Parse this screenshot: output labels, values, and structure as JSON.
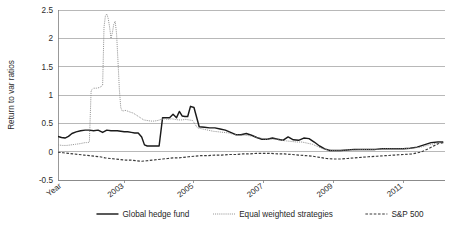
{
  "chart_data": {
    "type": "line",
    "title": "",
    "xlabel": "Year",
    "ylabel": "Return to var ratios",
    "ylim": [
      -0.5,
      2.5
    ],
    "ytick_labels": [
      "2.5",
      "2",
      "1.5",
      "1",
      "0.5",
      "0",
      "-0.5"
    ],
    "ytick_values": [
      2.5,
      2,
      1.5,
      1,
      0.5,
      0,
      -0.5
    ],
    "xtick_labels": [
      "2003",
      "2005",
      "2007",
      "2009",
      "2011"
    ],
    "xtick_values": [
      2003,
      2005,
      2007,
      2009,
      2011
    ],
    "xlim": [
      2001.1,
      2012.2
    ],
    "grid": "horizontal",
    "legend_position": "bottom",
    "legend": [
      {
        "name": "Global hedge fund",
        "style": "solid",
        "color": "#1a1a1a"
      },
      {
        "name": "Equal weighted strategies",
        "style": "dotted",
        "color": "#8c8c8c"
      },
      {
        "name": "S&P 500",
        "style": "dashed",
        "color": "#3a3a3a"
      }
    ],
    "series": [
      {
        "name": "Global hedge fund",
        "style": "solid",
        "color": "#1a1a1a",
        "x": [
          2001.1,
          2001.2,
          2001.3,
          2001.4,
          2001.5,
          2001.62,
          2001.75,
          2001.88,
          2002.0,
          2002.12,
          2002.25,
          2002.38,
          2002.5,
          2002.62,
          2002.7,
          2002.8,
          2002.9,
          2003.0,
          2003.1,
          2003.2,
          2003.3,
          2003.4,
          2003.5,
          2003.58,
          2003.66,
          2003.74,
          2003.82,
          2003.9,
          2004.0,
          2004.1,
          2004.2,
          2004.3,
          2004.4,
          2004.5,
          2004.58,
          2004.66,
          2004.74,
          2004.82,
          2004.9,
          2005.0,
          2005.15,
          2005.3,
          2005.45,
          2005.6,
          2005.75,
          2005.9,
          2006.05,
          2006.2,
          2006.35,
          2006.5,
          2006.65,
          2006.8,
          2006.95,
          2007.1,
          2007.25,
          2007.4,
          2007.55,
          2007.7,
          2007.85,
          2008.0,
          2008.15,
          2008.3,
          2008.45,
          2008.6,
          2008.75,
          2008.9,
          2009.05,
          2009.2,
          2009.4,
          2009.6,
          2009.8,
          2010.0,
          2010.2,
          2010.4,
          2010.6,
          2010.8,
          2011.0,
          2011.2,
          2011.4,
          2011.6,
          2011.8,
          2012.0,
          2012.15
        ],
        "y": [
          0.27,
          0.25,
          0.24,
          0.27,
          0.32,
          0.35,
          0.37,
          0.38,
          0.38,
          0.37,
          0.38,
          0.34,
          0.38,
          0.37,
          0.37,
          0.37,
          0.36,
          0.35,
          0.35,
          0.34,
          0.33,
          0.33,
          0.26,
          0.12,
          0.1,
          0.1,
          0.1,
          0.1,
          0.1,
          0.6,
          0.6,
          0.6,
          0.66,
          0.6,
          0.71,
          0.63,
          0.62,
          0.62,
          0.8,
          0.78,
          0.44,
          0.43,
          0.42,
          0.42,
          0.4,
          0.38,
          0.34,
          0.3,
          0.3,
          0.32,
          0.29,
          0.25,
          0.22,
          0.22,
          0.24,
          0.22,
          0.2,
          0.26,
          0.21,
          0.2,
          0.24,
          0.23,
          0.17,
          0.1,
          0.05,
          0.02,
          0.02,
          0.02,
          0.03,
          0.04,
          0.04,
          0.04,
          0.04,
          0.05,
          0.05,
          0.05,
          0.05,
          0.06,
          0.08,
          0.12,
          0.16,
          0.17,
          0.17
        ]
      },
      {
        "name": "Equal weighted strategies",
        "style": "dotted",
        "color": "#8c8c8c",
        "x": [
          2001.1,
          2001.22,
          2001.35,
          2001.48,
          2001.6,
          2001.72,
          2001.8,
          2001.88,
          2001.92,
          2001.96,
          2002.0,
          2002.05,
          2002.12,
          2002.2,
          2002.28,
          2002.34,
          2002.38,
          2002.42,
          2002.46,
          2002.5,
          2002.54,
          2002.58,
          2002.62,
          2002.66,
          2002.7,
          2002.74,
          2002.78,
          2002.82,
          2002.86,
          2002.9,
          2002.94,
          2002.98,
          2003.02,
          2003.08,
          2003.16,
          2003.26,
          2003.36,
          2003.46,
          2003.56,
          2003.66,
          2003.76,
          2003.86,
          2003.96,
          2004.06,
          2004.16,
          2004.26,
          2004.36,
          2004.46,
          2004.56,
          2004.66,
          2004.76,
          2004.86,
          2004.96,
          2005.1,
          2005.25,
          2005.4,
          2005.55,
          2005.7,
          2005.85,
          2006.0,
          2006.15,
          2006.3,
          2006.45,
          2006.6,
          2006.75,
          2006.9,
          2007.05,
          2007.2,
          2007.35,
          2007.5,
          2007.65,
          2007.8,
          2007.95,
          2008.1,
          2008.25,
          2008.4,
          2008.55,
          2008.7,
          2008.85,
          2009.0,
          2009.2,
          2009.4,
          2009.6,
          2009.8,
          2010.0,
          2010.25,
          2010.5,
          2010.75,
          2011.0,
          2011.25,
          2011.5,
          2011.75,
          2012.0,
          2012.15
        ],
        "y": [
          0.12,
          0.11,
          0.11,
          0.12,
          0.13,
          0.14,
          0.15,
          0.16,
          0.16,
          0.16,
          0.17,
          1.08,
          1.12,
          1.12,
          1.13,
          1.15,
          1.17,
          2.2,
          2.4,
          2.43,
          2.35,
          2.2,
          2.0,
          2.1,
          2.25,
          2.3,
          2.08,
          1.6,
          1.1,
          0.78,
          0.72,
          0.72,
          0.73,
          0.72,
          0.7,
          0.68,
          0.64,
          0.6,
          0.56,
          0.55,
          0.54,
          0.54,
          0.55,
          0.57,
          0.58,
          0.57,
          0.58,
          0.57,
          0.56,
          0.56,
          0.57,
          0.56,
          0.55,
          0.42,
          0.4,
          0.38,
          0.36,
          0.35,
          0.34,
          0.33,
          0.3,
          0.29,
          0.29,
          0.28,
          0.26,
          0.24,
          0.22,
          0.22,
          0.22,
          0.2,
          0.19,
          0.18,
          0.17,
          0.17,
          0.15,
          0.13,
          0.09,
          0.05,
          0.03,
          0.02,
          0.02,
          0.03,
          0.03,
          0.04,
          0.04,
          0.04,
          0.05,
          0.05,
          0.05,
          0.06,
          0.08,
          0.12,
          0.16,
          0.17
        ]
      },
      {
        "name": "S&P 500",
        "style": "dashed",
        "color": "#3a3a3a",
        "x": [
          2001.1,
          2001.25,
          2001.4,
          2001.55,
          2001.7,
          2001.85,
          2002.0,
          2002.15,
          2002.3,
          2002.45,
          2002.6,
          2002.75,
          2002.9,
          2003.05,
          2003.2,
          2003.35,
          2003.5,
          2003.65,
          2003.8,
          2003.95,
          2004.1,
          2004.25,
          2004.4,
          2004.55,
          2004.7,
          2004.85,
          2005.0,
          2005.2,
          2005.4,
          2005.6,
          2005.8,
          2006.0,
          2006.2,
          2006.4,
          2006.6,
          2006.8,
          2007.0,
          2007.2,
          2007.4,
          2007.6,
          2007.8,
          2008.0,
          2008.2,
          2008.4,
          2008.6,
          2008.8,
          2009.0,
          2009.2,
          2009.4,
          2009.6,
          2009.8,
          2010.0,
          2010.25,
          2010.5,
          2010.75,
          2011.0,
          2011.25,
          2011.5,
          2011.75,
          2012.0,
          2012.15
        ],
        "y": [
          -0.01,
          -0.02,
          -0.03,
          -0.04,
          -0.05,
          -0.06,
          -0.07,
          -0.08,
          -0.09,
          -0.11,
          -0.12,
          -0.13,
          -0.14,
          -0.15,
          -0.15,
          -0.16,
          -0.17,
          -0.16,
          -0.15,
          -0.14,
          -0.13,
          -0.12,
          -0.11,
          -0.11,
          -0.1,
          -0.09,
          -0.08,
          -0.07,
          -0.07,
          -0.06,
          -0.06,
          -0.05,
          -0.05,
          -0.04,
          -0.04,
          -0.03,
          -0.03,
          -0.03,
          -0.04,
          -0.04,
          -0.05,
          -0.06,
          -0.07,
          -0.08,
          -0.1,
          -0.12,
          -0.13,
          -0.13,
          -0.12,
          -0.11,
          -0.1,
          -0.09,
          -0.08,
          -0.07,
          -0.06,
          -0.05,
          -0.04,
          -0.01,
          0.06,
          0.14,
          0.16
        ]
      }
    ]
  }
}
